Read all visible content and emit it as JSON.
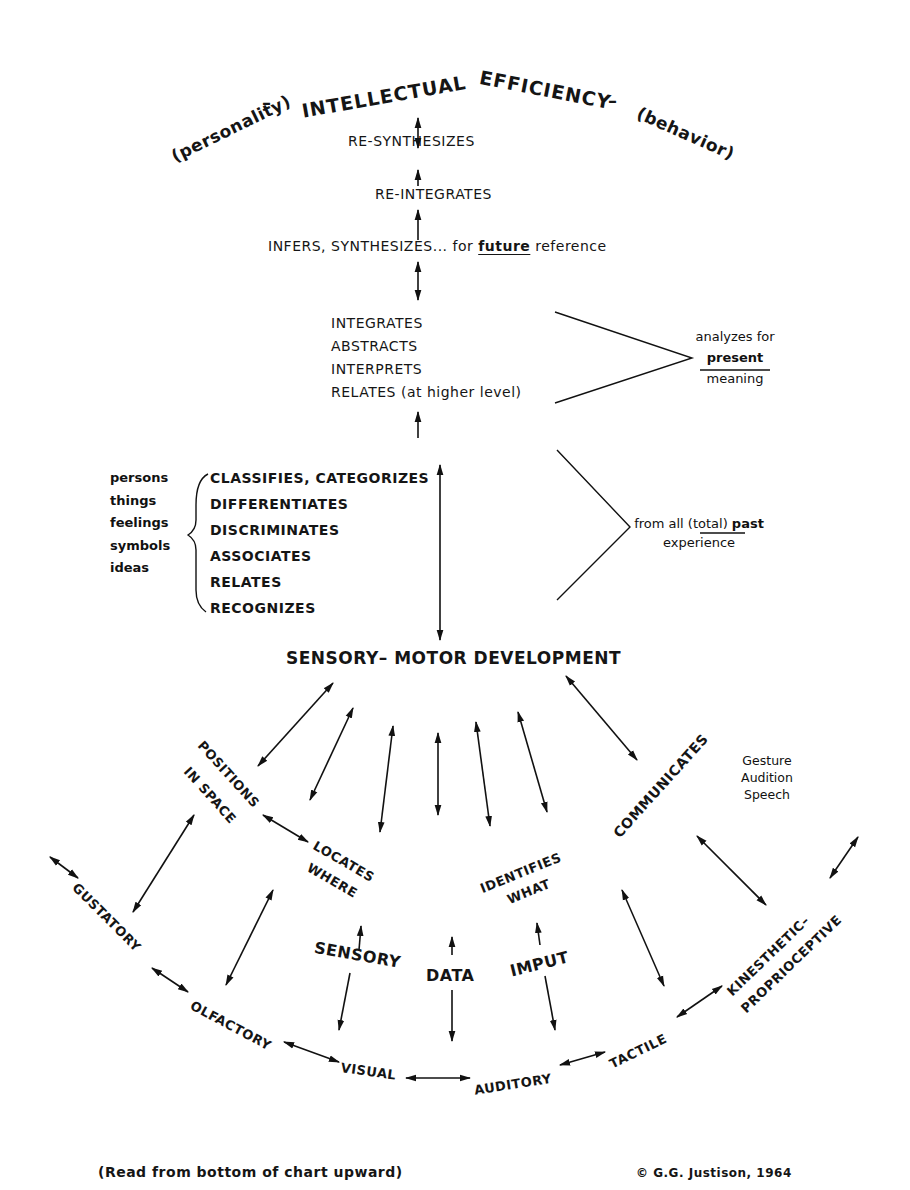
{
  "header": {
    "title_left": "INTELLECTUAL",
    "title_right": "EFFICIENCY",
    "dash_left": "–",
    "dash_right": "–",
    "left_qualifier": "(personality)",
    "right_qualifier": "(behavior)"
  },
  "upper_chain": {
    "resynthesizes": "RE-SYNTHESIZES",
    "reintegrates": "RE-INTEGRATES",
    "infers": "INFERS, SYNTHESIZES...",
    "infers_for": "for",
    "infers_future": "future",
    "infers_reference": "reference"
  },
  "present_group": {
    "items": [
      "INTEGRATES",
      "ABSTRACTS",
      "INTERPRETS",
      "RELATES (at higher level)"
    ],
    "note_line1": "analyzes for",
    "note_line2": "present",
    "note_line3": "meaning"
  },
  "past_group": {
    "objects": [
      "persons",
      "things",
      "feelings",
      "symbols",
      "ideas"
    ],
    "items": [
      "CLASSIFIES, CATEGORIZES",
      "DIFFERENTIATES",
      "DISCRIMINATES",
      "ASSOCIATES",
      "RELATES",
      "RECOGNIZES"
    ],
    "note_line1_a": "from all (total)",
    "note_line1_b": "past",
    "note_line2": "experience"
  },
  "hub": {
    "label": "SENSORY– MOTOR DEVELOPMENT"
  },
  "middle_nodes": {
    "positions_line1": "POSITIONS",
    "positions_line2": "IN SPACE",
    "locates_line1": "LOCATES",
    "locates_line2": "WHERE",
    "identifies_line1": "IDENTIFIES",
    "identifies_line2": "WHAT",
    "communicates": "COMMUNICATES",
    "communicates_modes": [
      "Gesture",
      "Audition",
      "Speech"
    ]
  },
  "input_label": {
    "sensory": "SENSORY",
    "data": "DATA",
    "imput": "IMPUT"
  },
  "senses": {
    "gustatory": "GUSTATORY",
    "olfactory": "OLFACTORY",
    "visual": "VISUAL",
    "auditory": "AUDITORY",
    "tactile": "TACTILE",
    "kinesthetic_line1": "KINESTHETIC–",
    "kinesthetic_line2": "PROPRIOCEPTIVE"
  },
  "footer": {
    "instruction": "(Read  from bottom of chart upward)",
    "copyright": "© G.G. Justison, 1964"
  }
}
